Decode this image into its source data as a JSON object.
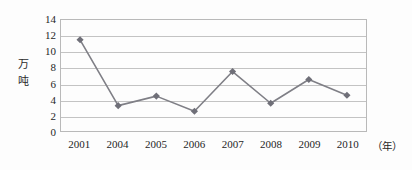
{
  "chart_data": {
    "type": "line",
    "title": "",
    "xlabel": "年",
    "ylabel": "万吨",
    "ylim": [
      0,
      14
    ],
    "ytick_step": 2,
    "grid": true,
    "legend": "none",
    "categories": [
      "2001",
      "2004",
      "2005",
      "2006",
      "2007",
      "2008",
      "2009",
      "2010"
    ],
    "values": [
      11.5,
      3.2,
      4.4,
      2.5,
      7.5,
      3.5,
      6.5,
      4.5
    ],
    "yticks": [
      "0",
      "2",
      "4",
      "6",
      "8",
      "10",
      "12",
      "14"
    ],
    "series": [
      {
        "name": "产量",
        "values": [
          11.5,
          3.2,
          4.4,
          2.5,
          7.5,
          3.5,
          6.5,
          4.5
        ]
      }
    ]
  },
  "axis": {
    "y_title_chars": [
      "万",
      "吨"
    ],
    "x_unit_label": "（年）"
  },
  "style": {
    "series_color": "#7f7f86",
    "marker_color": "#6f6f78",
    "gridline_color": "#c3c3c3",
    "plot_border_color": "#b9b9b9",
    "text_color": "#1f1f1f",
    "background": "#fdfdfd"
  }
}
